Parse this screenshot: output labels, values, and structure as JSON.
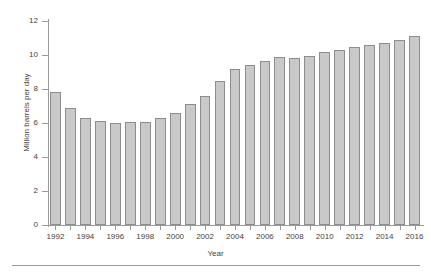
{
  "chart_data": {
    "type": "bar",
    "title": "",
    "xlabel": "Year",
    "ylabel": "Million barrels per day",
    "ylim": [
      0,
      12
    ],
    "yticks": [
      0,
      2,
      4,
      6,
      8,
      10,
      12
    ],
    "ytick_labels": [
      "0",
      "2",
      "4",
      "6",
      "8",
      "10",
      "12"
    ],
    "xtick_labels": [
      "1992",
      "1994",
      "1996",
      "1998",
      "2000",
      "2002",
      "2004",
      "2006",
      "2008",
      "2010",
      "2012",
      "2014",
      "2016"
    ],
    "grid": false,
    "legend": null,
    "bar_color": "#c9c9c9",
    "bar_edge_color": "#8d8d8d",
    "axis_color": "#9a9a9a",
    "categories": [
      "1992",
      "1993",
      "1994",
      "1995",
      "1996",
      "1997",
      "1998",
      "1999",
      "2000",
      "2001",
      "2002",
      "2003",
      "2004",
      "2005",
      "2006",
      "2007",
      "2008",
      "2009",
      "2010",
      "2011",
      "2012",
      "2013",
      "2014",
      "2015",
      "2016"
    ],
    "values": [
      7.8,
      6.9,
      6.3,
      6.1,
      6.0,
      6.05,
      6.05,
      6.3,
      6.6,
      7.1,
      7.6,
      8.45,
      9.2,
      9.4,
      9.65,
      9.9,
      9.8,
      9.95,
      10.2,
      10.3,
      10.45,
      10.6,
      10.7,
      10.9,
      11.1
    ],
    "series": [
      {
        "name": "Million barrels per day",
        "values": [
          7.8,
          6.9,
          6.3,
          6.1,
          6.0,
          6.05,
          6.05,
          6.3,
          6.6,
          7.1,
          7.6,
          8.45,
          9.2,
          9.4,
          9.65,
          9.9,
          9.8,
          9.95,
          10.2,
          10.3,
          10.45,
          10.6,
          10.7,
          10.9,
          11.1
        ]
      }
    ]
  }
}
